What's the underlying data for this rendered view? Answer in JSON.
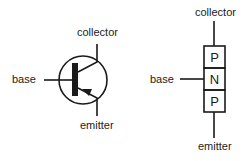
{
  "diagram": {
    "symbol": {
      "labels": {
        "collector": "collector",
        "base": "base",
        "emitter": "emitter"
      }
    },
    "structure": {
      "labels": {
        "collector": "collector",
        "base": "base",
        "emitter": "emitter"
      },
      "layers": [
        "P",
        "N",
        "P"
      ]
    },
    "colors": {
      "stroke": "#1a1a1a",
      "text": "#222222",
      "background": "#ffffff"
    }
  }
}
